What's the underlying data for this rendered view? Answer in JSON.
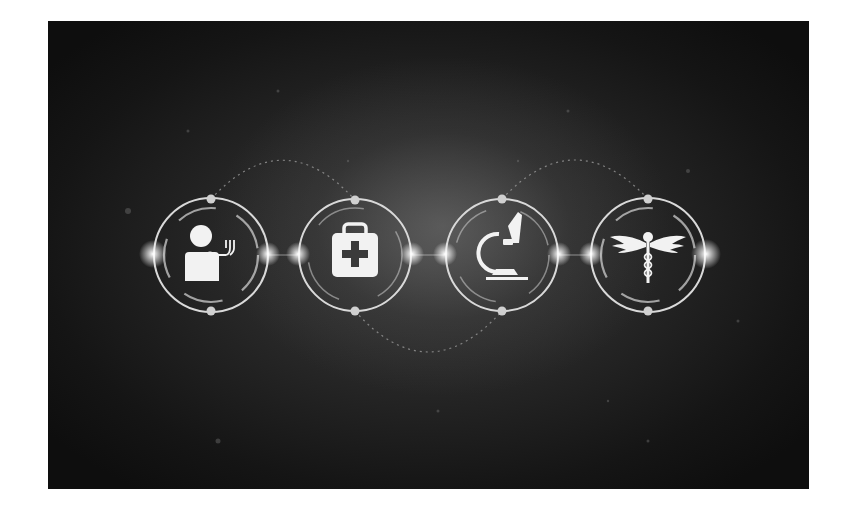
{
  "image": {
    "description": "Dark background medical technology banner with four glowing ring icons connected by light nodes",
    "background_color": "#1a1a1a",
    "ring_color": "#d8d8d8",
    "icon_color": "#f2f2f2"
  },
  "icons": [
    {
      "name": "doctor-stethoscope",
      "cx": 163,
      "cy": 234
    },
    {
      "name": "first-aid-kit",
      "cx": 307,
      "cy": 234
    },
    {
      "name": "microscope",
      "cx": 454,
      "cy": 234
    },
    {
      "name": "caduceus",
      "cx": 600,
      "cy": 234
    }
  ]
}
